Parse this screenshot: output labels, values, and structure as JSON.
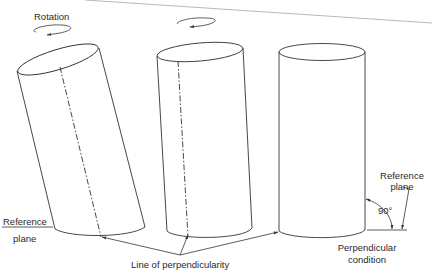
{
  "figure": {
    "labels": {
      "rotation": "Rotation",
      "reference_plane_left_line1": "Reference",
      "reference_plane_left_line2": "plane",
      "line_of_perpendicularity": "Line of perpendicularity",
      "reference_plane_right_line1": "Reference",
      "reference_plane_right_line2": "plane",
      "angle": "90°",
      "perpendicular_condition_line1": "Perpendicular",
      "perpendicular_condition_line2": "condition"
    },
    "cylinders": [
      {
        "name": "tilted-cylinder",
        "state": "tilted, with dashed line of perpendicularity"
      },
      {
        "name": "slightly-tilted-cylinder",
        "state": "rotating toward upright, with dashed line of perpendicularity"
      },
      {
        "name": "upright-cylinder",
        "state": "perpendicular condition"
      }
    ],
    "colors": {
      "stroke": "#333333",
      "text": "#2a2a2a",
      "background": "#ffffff"
    }
  }
}
